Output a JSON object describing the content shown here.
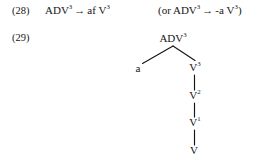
{
  "page": {
    "background": "#ffffff",
    "ink": "#161616"
  },
  "examples": [
    {
      "number": "(28)",
      "rule": {
        "lhs": "ADV",
        "lhs_sup": "3",
        "arrow": "→",
        "rhs_prefix": "af",
        "rhs": "V",
        "rhs_sup": "3"
      },
      "alternative": {
        "open_paren": "(or ",
        "lhs": "ADV",
        "lhs_sup": "3",
        "arrow": "→",
        "rhs_prefix": "-a",
        "rhs": "V",
        "rhs_sup": "3",
        "close_paren": ")"
      }
    },
    {
      "number": "(29)",
      "tree": {
        "root": {
          "label": "ADV",
          "sup": "3"
        },
        "left_child": {
          "label": "a",
          "sup": ""
        },
        "right_chain": [
          {
            "label": "V",
            "sup": "3"
          },
          {
            "label": "V",
            "sup": "2"
          },
          {
            "label": "V",
            "sup": "1"
          },
          {
            "label": "V",
            "sup": ""
          }
        ]
      }
    }
  ]
}
